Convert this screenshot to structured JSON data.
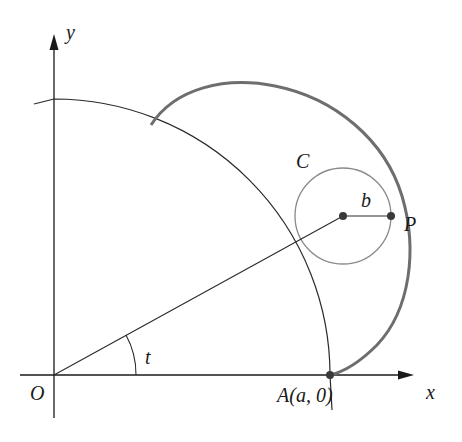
{
  "figure": {
    "labels": {
      "y_axis": "y",
      "x_axis": "x",
      "origin": "O",
      "point_a": "A(a, 0)",
      "circle": "C",
      "radius": "b",
      "point_p": "P",
      "angle": "t"
    },
    "colors": {
      "axes": "#1a1a1a",
      "thin_lines": "#2a2a2a",
      "circle": "#8a8a8a",
      "curve": "#6e6e6e",
      "points": "#3a3a3a"
    },
    "geometry": {
      "origin_px": [
        54,
        375
      ],
      "big_circle_radius_px": 276,
      "small_circle_center_px": [
        343,
        216
      ],
      "small_circle_radius_px": 48,
      "point_p_px": [
        391,
        216
      ],
      "point_a_px": [
        330,
        375
      ]
    }
  }
}
